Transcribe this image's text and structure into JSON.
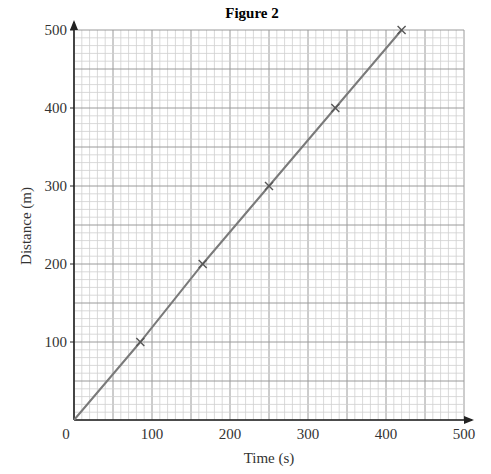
{
  "chart_data": {
    "type": "line",
    "title": "Figure 2",
    "xlabel": "Time (s)",
    "ylabel": "Distance (m)",
    "xlim": [
      0,
      500
    ],
    "ylim": [
      0,
      500
    ],
    "xticks": [
      0,
      100,
      200,
      300,
      400,
      500
    ],
    "yticks": [
      100,
      200,
      300,
      400,
      500
    ],
    "grid": {
      "on": true,
      "minor_step": 10,
      "major_step": 50
    },
    "series": [
      {
        "name": "Distance vs time",
        "x": [
          0,
          85,
          165,
          250,
          335,
          420
        ],
        "y": [
          0,
          100,
          200,
          300,
          400,
          500
        ],
        "marker": "x",
        "color": "#7a7a7a"
      }
    ],
    "annotations": []
  }
}
